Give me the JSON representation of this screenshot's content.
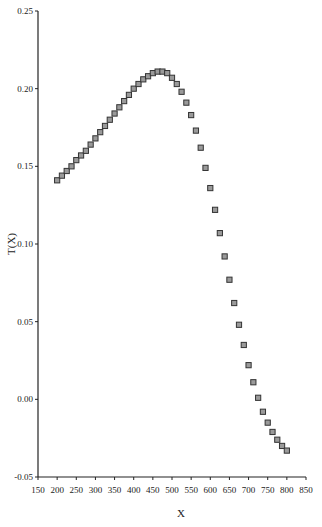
{
  "chart_data": {
    "type": "scatter",
    "title": "",
    "xlabel": "X",
    "ylabel": "T(X)",
    "xlim": [
      150,
      850
    ],
    "ylim": [
      -0.05,
      0.25
    ],
    "xticks": [
      "150",
      "200",
      "250",
      "300",
      "350",
      "400",
      "450",
      "500",
      "550",
      "600",
      "650",
      "700",
      "750",
      "800",
      "850"
    ],
    "yticks": [
      "-0.05",
      "0.00",
      "0.05",
      "0.10",
      "0.15",
      "0.20",
      "0.25"
    ],
    "grid": false,
    "legend": null,
    "marker": {
      "shape": "square",
      "fill": "#9a9a9a",
      "stroke": "#333333"
    },
    "series": [
      {
        "name": "T(X)",
        "x": [
          200,
          212.5,
          225,
          237.5,
          250,
          262.5,
          275,
          287.5,
          300,
          312.5,
          325,
          337.5,
          350,
          362.5,
          375,
          387.5,
          400,
          412.5,
          425,
          437.5,
          450,
          462.5,
          475,
          487.5,
          500,
          512.5,
          525,
          537.5,
          550,
          562.5,
          575,
          587.5,
          600,
          612.5,
          625,
          637.5,
          650,
          662.5,
          675,
          687.5,
          700,
          712.5,
          725,
          737.5,
          750,
          762.5,
          775,
          787.5,
          800
        ],
        "y": [
          0.141,
          0.144,
          0.147,
          0.15,
          0.154,
          0.157,
          0.16,
          0.164,
          0.168,
          0.172,
          0.176,
          0.18,
          0.184,
          0.188,
          0.192,
          0.196,
          0.2,
          0.203,
          0.206,
          0.208,
          0.21,
          0.211,
          0.211,
          0.21,
          0.207,
          0.203,
          0.198,
          0.191,
          0.183,
          0.173,
          0.162,
          0.149,
          0.136,
          0.122,
          0.107,
          0.092,
          0.077,
          0.062,
          0.048,
          0.035,
          0.022,
          0.011,
          0.001,
          -0.008,
          -0.015,
          -0.021,
          -0.026,
          -0.03,
          -0.033
        ]
      }
    ]
  }
}
